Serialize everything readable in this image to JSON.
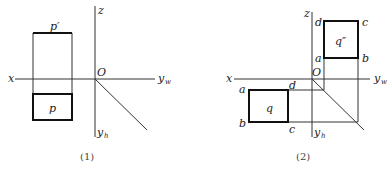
{
  "panel1": {
    "caption": "(1)",
    "axes": {
      "z": "z",
      "x": "x",
      "origin": "O",
      "yw": "y",
      "yw_sub": "w",
      "yh": "y",
      "yh_sub": "h"
    },
    "front_view_label": "p′",
    "top_view_label": "p"
  },
  "panel2": {
    "caption": "(2)",
    "axes": {
      "z": "z",
      "x": "x",
      "origin": "O",
      "yw": "y",
      "yw_sub": "w",
      "yh": "y",
      "yh_sub": "h"
    },
    "side_view_label": "q″",
    "side_view_vertices": {
      "d": "d",
      "c": "c",
      "a": "a",
      "b": "b"
    },
    "top_view_label": "q",
    "top_view_vertices": {
      "a": "a",
      "d": "d",
      "b": "b",
      "c": "c"
    }
  }
}
